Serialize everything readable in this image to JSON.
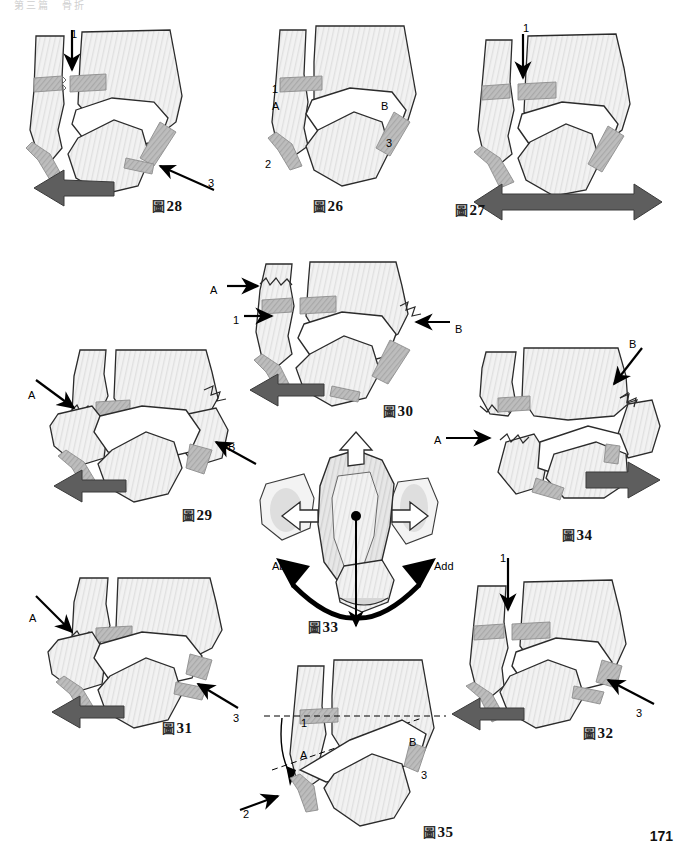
{
  "page": {
    "running_head": "第三篇　骨折",
    "folio": "171",
    "figure_word": "圖"
  },
  "figures": [
    {
      "id": "fig28",
      "number": "28",
      "caption": "圖 28",
      "caption_pos": {
        "x": 152,
        "y": 196
      },
      "labels": [
        {
          "text": "1",
          "x": 71,
          "y": 28
        },
        {
          "text": "3",
          "x": 208,
          "y": 177
        }
      ]
    },
    {
      "id": "fig26",
      "number": "26",
      "caption": "圖 26",
      "caption_pos": {
        "x": 313,
        "y": 196
      },
      "labels": [
        {
          "text": "1",
          "x": 272,
          "y": 83
        },
        {
          "text": "A",
          "x": 272,
          "y": 100
        },
        {
          "text": "B",
          "x": 381,
          "y": 100
        },
        {
          "text": "2",
          "x": 265,
          "y": 158
        },
        {
          "text": "3",
          "x": 386,
          "y": 137
        }
      ]
    },
    {
      "id": "fig27",
      "number": "27",
      "caption": "圖 27",
      "caption_pos": {
        "x": 455,
        "y": 200
      },
      "labels": [
        {
          "text": "1",
          "x": 523,
          "y": 22
        }
      ]
    },
    {
      "id": "fig30",
      "number": "30",
      "caption": "圖 30",
      "caption_pos": {
        "x": 383,
        "y": 401
      },
      "labels": [
        {
          "text": "A",
          "x": 210,
          "y": 284
        },
        {
          "text": "1",
          "x": 233,
          "y": 314
        },
        {
          "text": "B",
          "x": 455,
          "y": 323
        }
      ]
    },
    {
      "id": "fig29",
      "number": "29",
      "caption": "圖 29",
      "caption_pos": {
        "x": 182,
        "y": 505
      },
      "labels": [
        {
          "text": "A",
          "x": 28,
          "y": 389
        },
        {
          "text": "B",
          "x": 228,
          "y": 441
        }
      ]
    },
    {
      "id": "fig34",
      "number": "34",
      "caption": "圖 34",
      "caption_pos": {
        "x": 562,
        "y": 525
      },
      "labels": [
        {
          "text": "B",
          "x": 629,
          "y": 338
        },
        {
          "text": "A",
          "x": 434,
          "y": 434
        }
      ]
    },
    {
      "id": "fig33",
      "number": "33",
      "caption": "圖 33",
      "caption_pos": {
        "x": 308,
        "y": 617
      },
      "labels": [
        {
          "text": "Abd",
          "x": 272,
          "y": 560
        },
        {
          "text": "Add",
          "x": 434,
          "y": 560
        }
      ]
    },
    {
      "id": "fig31",
      "number": "31",
      "caption": "圖 31",
      "caption_pos": {
        "x": 162,
        "y": 718
      },
      "labels": [
        {
          "text": "A",
          "x": 29,
          "y": 612
        },
        {
          "text": "3",
          "x": 233,
          "y": 712
        }
      ]
    },
    {
      "id": "fig32",
      "number": "32",
      "caption": "圖 32",
      "caption_pos": {
        "x": 583,
        "y": 723
      },
      "labels": [
        {
          "text": "1",
          "x": 500,
          "y": 552
        },
        {
          "text": "3",
          "x": 636,
          "y": 707
        }
      ]
    },
    {
      "id": "fig35",
      "number": "35",
      "caption": "圖 35",
      "caption_pos": {
        "x": 423,
        "y": 822
      },
      "labels": [
        {
          "text": "1",
          "x": 301,
          "y": 717
        },
        {
          "text": "A",
          "x": 300,
          "y": 749
        },
        {
          "text": "B",
          "x": 409,
          "y": 736
        },
        {
          "text": "3",
          "x": 421,
          "y": 769
        },
        {
          "text": "2",
          "x": 243,
          "y": 808
        }
      ]
    }
  ],
  "colors": {
    "bone_fill": "#f1f1f1",
    "bone_stroke": "#2b2b2b",
    "ligament_fill": "#b9b9b9",
    "ligament_stroke": "#8d8d8d",
    "dark_arrow": "#5e5e5e",
    "black_arrow": "#000000",
    "hollow_arrow_fill": "#ffffff",
    "cartilage_fill": "#ffffff",
    "page_background": "#ffffff"
  }
}
